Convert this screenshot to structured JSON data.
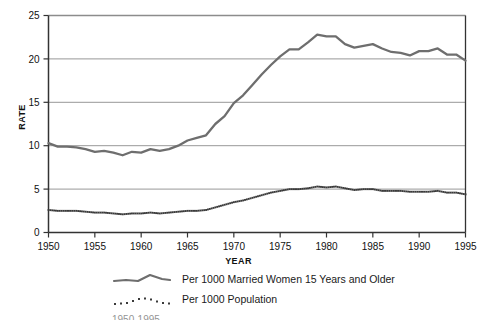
{
  "chart_data": {
    "type": "line",
    "title": "",
    "xlabel": "YEAR",
    "ylabel": "RATE",
    "xlim": [
      1950,
      1995
    ],
    "ylim": [
      0,
      25
    ],
    "xticks": [
      1950,
      1955,
      1960,
      1965,
      1970,
      1975,
      1980,
      1985,
      1990,
      1995
    ],
    "yticks": [
      0,
      5,
      10,
      15,
      20,
      25
    ],
    "grid": "horizontal",
    "legend_position": "below",
    "colors": {
      "series_married": "#6e6e6e",
      "series_population": "#3a3a3a",
      "grid": "#8c8c8c",
      "axis": "#333333"
    },
    "x": [
      1950,
      1951,
      1952,
      1953,
      1954,
      1955,
      1956,
      1957,
      1958,
      1959,
      1960,
      1961,
      1962,
      1963,
      1964,
      1965,
      1966,
      1967,
      1968,
      1969,
      1970,
      1971,
      1972,
      1973,
      1974,
      1975,
      1976,
      1977,
      1978,
      1979,
      1980,
      1981,
      1982,
      1983,
      1984,
      1985,
      1986,
      1987,
      1988,
      1989,
      1990,
      1991,
      1992,
      1993,
      1994,
      1995
    ],
    "series": [
      {
        "name": "Per 1000 Married Women 15 Years and Older",
        "style": "solid",
        "values": [
          10.3,
          9.9,
          9.9,
          9.8,
          9.6,
          9.3,
          9.4,
          9.2,
          8.9,
          9.3,
          9.2,
          9.6,
          9.4,
          9.6,
          10.0,
          10.6,
          10.9,
          11.2,
          12.5,
          13.4,
          14.9,
          15.8,
          17.0,
          18.2,
          19.3,
          20.3,
          21.1,
          21.1,
          21.9,
          22.8,
          22.6,
          22.6,
          21.7,
          21.3,
          21.5,
          21.7,
          21.2,
          20.8,
          20.7,
          20.4,
          20.9,
          20.9,
          21.2,
          20.5,
          20.5,
          19.8
        ]
      },
      {
        "name": "Per 1000 Population",
        "style": "dotted",
        "values": [
          2.6,
          2.5,
          2.5,
          2.5,
          2.4,
          2.3,
          2.3,
          2.2,
          2.1,
          2.2,
          2.2,
          2.3,
          2.2,
          2.3,
          2.4,
          2.5,
          2.5,
          2.6,
          2.9,
          3.2,
          3.5,
          3.7,
          4.0,
          4.3,
          4.6,
          4.8,
          5.0,
          5.0,
          5.1,
          5.3,
          5.2,
          5.3,
          5.1,
          4.9,
          5.0,
          5.0,
          4.8,
          4.8,
          4.8,
          4.7,
          4.7,
          4.7,
          4.8,
          4.6,
          4.6,
          4.4
        ]
      }
    ]
  },
  "legend": {
    "items": [
      {
        "label": "Per 1000 Married Women 15 Years and Older",
        "style": "solid"
      },
      {
        "label": "Per 1000 Population",
        "style": "dotted"
      }
    ]
  },
  "caption": {
    "text": "1950-1995"
  }
}
